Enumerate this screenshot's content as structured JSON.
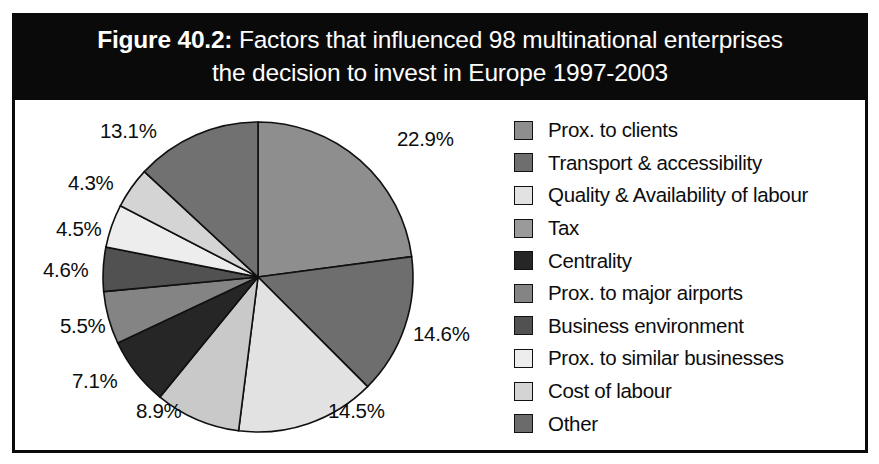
{
  "figure": {
    "number": "Figure 40.2:",
    "title_line_1": "Factors that influenced 98 multinational enterprises",
    "title_line_2": "the decision to invest in Europe 1997-2003",
    "title_bar_bg": "#0a0a0a",
    "title_bar_fg": "#ffffff",
    "frame_color": "#0a0a0a",
    "background": "#ffffff"
  },
  "chart_data": {
    "type": "pie",
    "title": "Figure 40.2: Factors that influenced 98 multinational enterprises the decision to invest in Europe 1997-2003",
    "xlabel": "",
    "ylabel": "",
    "unit": "%",
    "start_angle_deg": 0,
    "direction": "clockwise",
    "legend_position": "right",
    "grid": false,
    "categories": [
      "Prox. to clients",
      "Transport & accessibility",
      "Quality & Availability of labour",
      "Tax",
      "Centrality",
      "Prox. to major airports",
      "Business environment",
      "Prox. to similar businesses",
      "Cost of labour",
      "Other"
    ],
    "values": [
      22.9,
      14.6,
      14.5,
      8.9,
      7.1,
      5.5,
      4.6,
      4.5,
      4.3,
      13.1
    ],
    "value_labels": [
      "22.9%",
      "14.6%",
      "14.5%",
      "8.9%",
      "7.1%",
      "5.5%",
      "4.6%",
      "4.5%",
      "4.3%",
      "13.1%"
    ],
    "colors": [
      "#8e8e8e",
      "#6e6e6e",
      "#e2e2e2",
      "#c9c9c9",
      "#262626",
      "#848484",
      "#515151",
      "#ededed",
      "#d4d4d4",
      "#717171"
    ],
    "slice_edge_color": "#101010",
    "total": 100.0
  },
  "labels": {
    "p1": "22.9%",
    "p2": "14.6%",
    "p3": "14.5%",
    "p4": "8.9%",
    "p5": "7.1%",
    "p6": "5.5%",
    "p7": "4.6%",
    "p8": "4.5%",
    "p9": "4.3%",
    "p10": "13.1%"
  },
  "legend": {
    "items": [
      {
        "label": "Prox. to clients",
        "color": "#8e8e8e"
      },
      {
        "label": "Transport & accessibility",
        "color": "#6e6e6e"
      },
      {
        "label": "Quality & Availability of labour",
        "color": "#e2e2e2"
      },
      {
        "label": "Tax",
        "color": "#9a9a9a"
      },
      {
        "label": "Centrality",
        "color": "#262626"
      },
      {
        "label": "Prox. to major airports",
        "color": "#848484"
      },
      {
        "label": "Business environment",
        "color": "#515151"
      },
      {
        "label": "Prox. to similar businesses",
        "color": "#ededed"
      },
      {
        "label": "Cost of labour",
        "color": "#d4d4d4"
      },
      {
        "label": "Other",
        "color": "#6b6b6b"
      }
    ]
  }
}
